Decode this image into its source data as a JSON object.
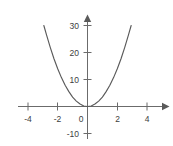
{
  "chart_data": {
    "type": "line",
    "title": "",
    "subtitle": "",
    "xlabel": "",
    "ylabel": "",
    "function": "y = 3.5x^2",
    "xlim": [
      -4.5,
      5.0
    ],
    "ylim": [
      -13,
      33
    ],
    "grid": false,
    "legend": null,
    "x_ticks": [
      -4,
      -2,
      0,
      2,
      4
    ],
    "x_tick_labels": [
      "-4",
      "-2",
      "0",
      "2",
      "4"
    ],
    "y_ticks": [
      -10,
      10,
      20,
      30
    ],
    "y_tick_labels": [
      "-10",
      "10",
      "20",
      "30"
    ],
    "origin_label": "0",
    "axis_arrows": [
      "x-positive",
      "y-positive"
    ],
    "series": [
      {
        "name": "parabola",
        "color": "#5a5a5a",
        "x": [
          -2.93,
          -2.75,
          -2.5,
          -2.25,
          -2.0,
          -1.75,
          -1.5,
          -1.25,
          -1.0,
          -0.75,
          -0.5,
          -0.25,
          0,
          0.25,
          0.5,
          0.75,
          1.0,
          1.25,
          1.5,
          1.75,
          2.0,
          2.25,
          2.5,
          2.75,
          2.93
        ],
        "values": [
          30.0,
          26.5,
          21.9,
          17.7,
          14.0,
          10.7,
          7.9,
          5.5,
          3.5,
          2.0,
          0.9,
          0.2,
          0,
          0.2,
          0.9,
          2.0,
          3.5,
          5.5,
          7.9,
          10.7,
          14.0,
          17.7,
          21.9,
          26.5,
          30.0
        ]
      }
    ]
  },
  "axis": {
    "x_tick_neg4": "-4",
    "x_tick_neg2": "-2",
    "x_tick_pos2": "2",
    "x_tick_pos4": "4",
    "origin": "0",
    "y_tick_30": "30",
    "y_tick_20": "20",
    "y_tick_10": "10",
    "y_tick_neg10": "-10"
  },
  "colors": {
    "background": "#ffffff",
    "axis": "#6b6b6b",
    "curve": "#5a5a5a",
    "text": "#3d3d3d"
  }
}
